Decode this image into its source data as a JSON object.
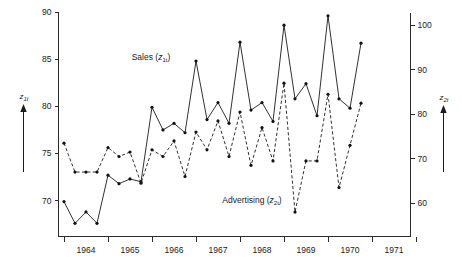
{
  "chart_data": {
    "type": "line",
    "title": "",
    "xlabel": "",
    "ylabel": "z_1t",
    "grid": false,
    "legend_position": "inline-annotations",
    "x_axis": {
      "tick_labels": [
        "1964",
        "1965",
        "1966",
        "1967",
        "1968",
        "1969",
        "1970",
        "1971"
      ],
      "tick_label_placement": "between-ticks",
      "tick_count": 9,
      "range_start": 1963.75,
      "range_end": 1971.75,
      "period": "quarterly"
    },
    "y_axis_left": {
      "label": "z_1t",
      "tick_labels": [
        "70",
        "75",
        "80",
        "85",
        "90"
      ],
      "tick_values": [
        70,
        75,
        80,
        85,
        90
      ],
      "min": 66.2,
      "max": 90
    },
    "y_axis_right": {
      "label": "z_2t",
      "tick_labels": [
        "60",
        "70",
        "80",
        "90",
        "100"
      ],
      "tick_values": [
        60,
        70,
        80,
        90,
        100
      ],
      "min": 52.5,
      "max": 103.0
    },
    "series": [
      {
        "name": "Sales (z_1t)",
        "label_text": "Sales (",
        "label_sub_base": "z",
        "label_sub_script": "1t",
        "label_close": ")",
        "axis": "left",
        "style": "solid",
        "marker": "dot",
        "x": [
          1963.875,
          1964.125,
          1964.375,
          1964.625,
          1964.875,
          1965.125,
          1965.375,
          1965.625,
          1965.875,
          1966.125,
          1966.375,
          1966.625,
          1966.875,
          1967.125,
          1967.375,
          1967.625,
          1967.875,
          1968.125,
          1968.375,
          1968.625,
          1968.875,
          1969.125,
          1969.375,
          1969.625,
          1969.875,
          1970.125,
          1970.375,
          1970.625
        ],
        "values": [
          69.9,
          67.6,
          68.8,
          67.6,
          72.7,
          71.8,
          72.3,
          72.0,
          79.9,
          77.5,
          78.2,
          77.2,
          84.8,
          78.6,
          80.4,
          78.2,
          86.8,
          79.6,
          80.4,
          78.4,
          88.6,
          80.8,
          82.4,
          79.0,
          89.6,
          80.8,
          79.8,
          86.7
        ]
      },
      {
        "name": "Advertising (z_2t)",
        "label_text": "Advertising (",
        "label_sub_base": "z",
        "label_sub_script": "2t",
        "label_close": ")",
        "axis": "right",
        "style": "dashed",
        "marker": "dot",
        "x": [
          1963.875,
          1964.125,
          1964.375,
          1964.625,
          1964.875,
          1965.125,
          1965.375,
          1965.625,
          1965.875,
          1966.125,
          1966.375,
          1966.625,
          1966.875,
          1967.125,
          1967.375,
          1967.625,
          1967.875,
          1968.125,
          1968.375,
          1968.625,
          1968.875,
          1969.125,
          1969.375,
          1969.625,
          1969.875,
          1970.125,
          1970.375,
          1970.625
        ],
        "values": [
          73.5,
          67.0,
          67.0,
          67.0,
          72.5,
          70.5,
          71.5,
          64.5,
          72.0,
          70.5,
          74.0,
          66.0,
          76.0,
          72.0,
          78.5,
          70.5,
          80.5,
          68.5,
          77.0,
          69.5,
          87.0,
          58.0,
          69.5,
          69.5,
          84.5,
          63.5,
          73.0,
          82.5
        ]
      }
    ],
    "annotations": [
      {
        "text": "Sales (z1t)",
        "x_px": 151,
        "y_px": 57
      },
      {
        "text": "Advertising (z2t)",
        "x_px": 250,
        "y_px": 200
      }
    ]
  },
  "axis_titles": {
    "left": {
      "base": "z",
      "script": "1t"
    },
    "right": {
      "base": "z",
      "script": "2t"
    }
  }
}
